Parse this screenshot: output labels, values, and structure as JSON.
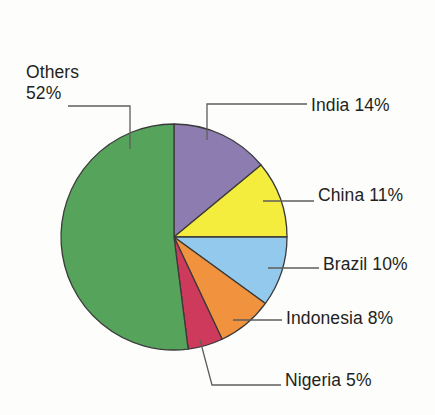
{
  "chart_data": {
    "type": "pie",
    "title": "",
    "subtitle": "",
    "xlabel": "",
    "ylabel": "",
    "legend_position": "none",
    "grid": false,
    "unit": "%",
    "total": 100,
    "start_angle_deg": 0,
    "direction": "clockwise",
    "categories": [
      "India",
      "China",
      "Brazil",
      "Indonesia",
      "Nigeria",
      "Others"
    ],
    "values": [
      14,
      11,
      10,
      8,
      5,
      52
    ],
    "colors": [
      "#8d7caf",
      "#f5ed3d",
      "#92c9ec",
      "#f0923e",
      "#ce3a5c",
      "#56a35c"
    ],
    "slices": [
      {
        "name": "India",
        "value": 14,
        "label": "India 14%",
        "color": "#8d7caf",
        "label_position": "right"
      },
      {
        "name": "China",
        "value": 11,
        "label": "China 11%",
        "color": "#f5ed3d",
        "label_position": "right"
      },
      {
        "name": "Brazil",
        "value": 10,
        "label": "Brazil 10%",
        "color": "#92c9ec",
        "label_position": "right"
      },
      {
        "name": "Indonesia",
        "value": 8,
        "label": "Indonesia 8%",
        "color": "#f0923e",
        "label_position": "right"
      },
      {
        "name": "Nigeria",
        "value": 5,
        "label": "Nigeria 5%",
        "color": "#ce3a5c",
        "label_position": "bottom-right"
      },
      {
        "name": "Others",
        "value": 52,
        "label": "Others 52%",
        "color": "#56a35c",
        "label_position": "top-left"
      }
    ]
  },
  "labels": {
    "others_name": "Others",
    "others_value": "52%",
    "india": "India 14%",
    "china": "China 11%",
    "brazil": "Brazil 10%",
    "indonesia": "Indonesia 8%",
    "nigeria": "Nigeria 5%"
  },
  "style": {
    "background": "#fdfdfc",
    "text_color": "#231f20",
    "slice_outline": "#3a3a3a",
    "leader_color": "#5d5d5d"
  }
}
